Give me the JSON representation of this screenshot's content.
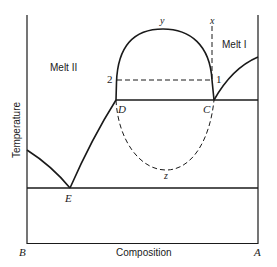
{
  "diagram": {
    "type": "phase-diagram",
    "axes": {
      "ylabel": "Temperature",
      "xlabel": "Composition",
      "left_end": "B",
      "right_end": "A"
    },
    "regions": {
      "melt_2": "Melt II",
      "melt_1": "Melt I"
    },
    "points": {
      "D": "D",
      "C": "C",
      "E": "E",
      "y": "y",
      "z": "z",
      "x": "x",
      "p1": "1",
      "p2": "2"
    },
    "colors": {
      "line": "#1a1a1a",
      "background": "#ffffff"
    }
  }
}
